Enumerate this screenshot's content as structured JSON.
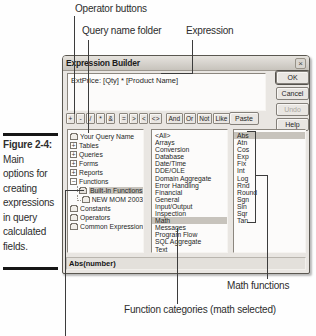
{
  "colors": {
    "selection": "#c7c3bc",
    "callout_line": "#3c3c3c"
  },
  "icons": {
    "close": "×",
    "expand": "+",
    "collapse": "−"
  },
  "callouts": {
    "operator_buttons": "Operator buttons",
    "query_name_folder": "Query name folder",
    "expression": "Expression",
    "math_functions": "Math functions",
    "function_categories": "Function categories (math selected)"
  },
  "figure": {
    "label": "Figure 2-4:",
    "lines": [
      "Main",
      "options for",
      "creating",
      "expressions",
      "in query",
      "calculated",
      "fields."
    ]
  },
  "dialog": {
    "title": "Expression Builder",
    "expression_text": "ExtPrice: [Qty] * [Product Name]",
    "buttons": {
      "ok": "OK",
      "cancel": "Cancel",
      "undo": "Undo",
      "help": "Help",
      "paste": "Paste"
    },
    "operator_buttons": [
      "+",
      "-",
      "/",
      "*",
      "&",
      "=",
      ">",
      "<",
      "<>",
      "And",
      "Or",
      "Not",
      "Like",
      "( )"
    ],
    "tree": [
      {
        "label": "Your Query Name",
        "icon": "folder"
      },
      {
        "label": "Tables",
        "icon": "expand-plus"
      },
      {
        "label": "Queries",
        "icon": "expand-plus"
      },
      {
        "label": "Forms",
        "icon": "expand-plus"
      },
      {
        "label": "Reports",
        "icon": "expand-plus"
      },
      {
        "label": "Functions",
        "icon": "expand-minus"
      },
      {
        "label": "Built-In Functions",
        "icon": "folder-open",
        "selected": true
      },
      {
        "label": "NEW MOM 2003",
        "icon": "folder"
      },
      {
        "label": "Constants",
        "icon": "folder"
      },
      {
        "label": "Operators",
        "icon": "folder"
      },
      {
        "label": "Common Expressions",
        "icon": "folder"
      }
    ],
    "categories": [
      "<All>",
      "Arrays",
      "Conversion",
      "Database",
      "Date/Time",
      "DDE/OLE",
      "Domain Aggregate",
      "Error Handling",
      "Financial",
      "General",
      "Input/Output",
      "Inspection",
      "Math",
      "Messages",
      "Program Flow",
      "SQL Aggregate",
      "Text"
    ],
    "categories_selected": "Math",
    "functions": [
      "Abs",
      "Atn",
      "Cos",
      "Exp",
      "Fix",
      "Int",
      "Log",
      "Rnd",
      "Round",
      "Sgn",
      "Sin",
      "Sqr",
      "Tan"
    ],
    "functions_selected": "Abs",
    "status": "Abs(number)"
  }
}
